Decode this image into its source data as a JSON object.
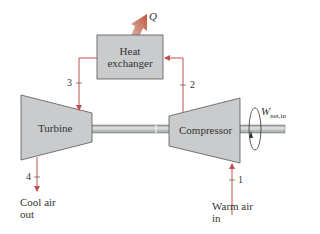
{
  "components": {
    "heat_exchanger": {
      "label_line1": "Heat",
      "label_line2": "exchanger"
    },
    "turbine": {
      "label": "Turbine"
    },
    "compressor": {
      "label": "Compressor"
    }
  },
  "heat_output": {
    "label": "Q"
  },
  "work_input": {
    "symbol": "W",
    "subscript": "net,in"
  },
  "states": [
    "1",
    "2",
    "3",
    "4"
  ],
  "inlet": {
    "line1": "Warm air",
    "line2": "in"
  },
  "outlet": {
    "line1": "Cool air",
    "line2": "out"
  },
  "colors": {
    "flow_line": "#c0504d",
    "component_fill": "#c9cbcd",
    "component_stroke": "#555555",
    "shaft_fill": "#b9bcbe",
    "heat_arrow": "#c8806a"
  }
}
